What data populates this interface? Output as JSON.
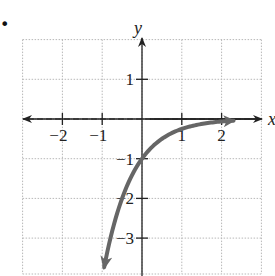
{
  "problem_marker": "•",
  "chart_data": {
    "type": "line",
    "title": "",
    "xlabel": "x",
    "ylabel": "y",
    "xlim": [
      -3,
      3
    ],
    "ylim": [
      -4,
      2
    ],
    "grid": true,
    "grid_style": "dotted",
    "x_ticks": [
      -2,
      -1,
      1,
      2
    ],
    "y_ticks": [
      1,
      -1,
      -2,
      -3
    ],
    "x_tick_labels": [
      "−2",
      "−1",
      "1",
      "2"
    ],
    "y_tick_labels": [
      "1",
      "−1",
      "−2",
      "−3"
    ],
    "asymptote": {
      "type": "horizontal",
      "y": 0,
      "style": "dashed"
    },
    "series": [
      {
        "name": "y = -4^(-x)",
        "color": "#666666",
        "points": [
          {
            "x": -0.95,
            "y": -3.73
          },
          {
            "x": -0.75,
            "y": -2.83
          },
          {
            "x": -0.5,
            "y": -2.0
          },
          {
            "x": -0.25,
            "y": -1.41
          },
          {
            "x": 0,
            "y": -1.0
          },
          {
            "x": 0.5,
            "y": -0.5
          },
          {
            "x": 1,
            "y": -0.25
          },
          {
            "x": 1.5,
            "y": -0.125
          },
          {
            "x": 2,
            "y": -0.0625
          },
          {
            "x": 2.3,
            "y": -0.04
          }
        ],
        "arrow_end": "both"
      }
    ]
  },
  "colors": {
    "axis": "#222222",
    "grid": "#b8b8b8",
    "curve": "#666666"
  }
}
